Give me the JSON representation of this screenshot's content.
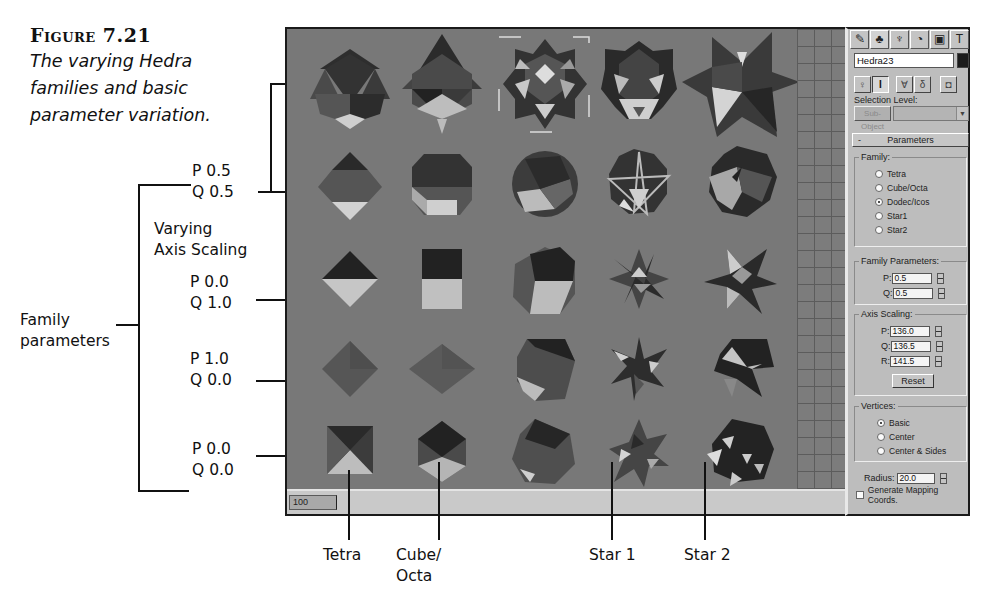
{
  "caption": {
    "figure_number": "Figure 7.21",
    "text_lines": [
      "The varying Hedra",
      "families and basic",
      "parameter variation."
    ]
  },
  "callouts": {
    "rows": [
      {
        "p": "P 0.5",
        "q": "Q 0.5"
      },
      {
        "p": "P 0.0",
        "q": "Q 1.0"
      },
      {
        "p": "P 1.0",
        "q": "Q 0.0"
      },
      {
        "p": "P 0.0",
        "q": "Q 0.0"
      }
    ],
    "varying_axis_scaling": [
      "Varying",
      "Axis Scaling"
    ],
    "family_parameters": [
      "Family",
      "parameters"
    ],
    "columns": [
      {
        "label_lines": [
          "Tetra"
        ]
      },
      {
        "label_lines": [
          "Cube/",
          "Octa"
        ]
      },
      {
        "label_lines": [
          "Star 1"
        ]
      },
      {
        "label_lines": [
          "Star 2"
        ]
      }
    ]
  },
  "viewport": {
    "frame_counter": "100",
    "background_color": "#787878",
    "grid_color": "#5c5c5c",
    "grid_rows": 5,
    "grid_columns": [
      "Tetra",
      "Cube/Octa",
      "Dodec/Icos",
      "Star1",
      "Star2"
    ],
    "selected_object": "Hedra23"
  },
  "command_panel": {
    "tabs": [
      {
        "name": "create-tab",
        "glyph": "✎"
      },
      {
        "name": "modify-tab",
        "glyph": "♣"
      },
      {
        "name": "hierarchy-tab",
        "glyph": "♆"
      },
      {
        "name": "motion-tab",
        "glyph": "◔"
      },
      {
        "name": "display-tab",
        "glyph": "▣"
      },
      {
        "name": "utilities-tab",
        "glyph": "T"
      }
    ],
    "object_name": "Hedra23",
    "object_color": "#1b1b1b",
    "selection_level_label": "Selection Level:",
    "sub_object_button": "Sub-Object",
    "tool_buttons": [
      {
        "name": "pin-stack",
        "glyph": "♀"
      },
      {
        "name": "show-end-result",
        "glyph": "I"
      },
      {
        "name": "make-unique",
        "glyph": "∀"
      },
      {
        "name": "remove-modifier",
        "glyph": "δ"
      },
      {
        "name": "configure-modifier-sets",
        "glyph": "◘"
      }
    ],
    "rollout": {
      "collapse": "-",
      "title": "Parameters"
    },
    "family": {
      "title": "Family:",
      "options": [
        "Tetra",
        "Cube/Octa",
        "Dodec/Icos",
        "Star1",
        "Star2"
      ],
      "selected": "Dodec/Icos"
    },
    "family_parameters": {
      "title": "Family Parameters:",
      "p_label": "P:",
      "p_value": "0.5",
      "q_label": "Q:",
      "q_value": "0.5"
    },
    "axis_scaling": {
      "title": "Axis Scaling:",
      "p_label": "P:",
      "p_value": "136.0",
      "q_label": "Q:",
      "q_value": "136.5",
      "r_label": "R:",
      "r_value": "141.5",
      "reset_label": "Reset"
    },
    "vertices": {
      "title": "Vertices:",
      "options": [
        "Basic",
        "Center",
        "Center & Sides"
      ],
      "selected": "Basic"
    },
    "radius": {
      "label": "Radius:",
      "value": "20.0"
    },
    "generate_mapping": {
      "label": "Generate Mapping Coords.",
      "checked": false
    }
  }
}
